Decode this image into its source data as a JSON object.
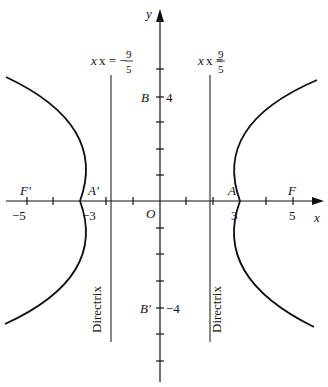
{
  "diagram": {
    "type": "hyperbola",
    "equation_implied": "x^2/9 - y^2/16 = 1",
    "axes": {
      "x_label": "x",
      "y_label": "y",
      "origin_label": "O"
    },
    "points": {
      "F": {
        "label": "F",
        "x": 5
      },
      "F_prime": {
        "label": "F′",
        "x": -5
      },
      "A": {
        "label": "A",
        "x": 3
      },
      "A_prime": {
        "label": "A′",
        "x": -3
      },
      "B": {
        "label": "B",
        "y": 4
      },
      "B_prime": {
        "label": "B′",
        "y": -4
      }
    },
    "tick_labels": {
      "x_neg5": "−5",
      "x_neg3": "−3",
      "x_3": "3",
      "x_5": "5",
      "y_4": "4",
      "y_neg4": "−4"
    },
    "directrices": {
      "left": {
        "label_prefix": "x = −",
        "num": "9",
        "den": "5"
      },
      "right": {
        "label_prefix": "x = ",
        "num": "9",
        "den": "5"
      },
      "text": "Directrix"
    }
  }
}
